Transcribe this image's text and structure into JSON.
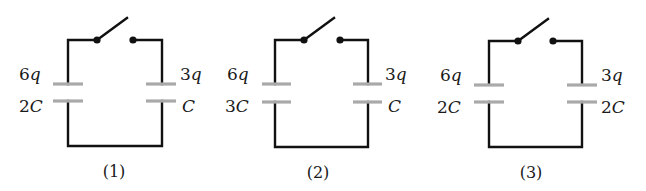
{
  "figure": {
    "colors": {
      "wire": "#111111",
      "plate": "#a9a9a9",
      "text": "#1a1a1a",
      "background": "#ffffff"
    },
    "circuits": [
      {
        "caption": "(1)",
        "left": {
          "charge": "6q",
          "charge_coef": "6",
          "charge_sym": "q",
          "capacitance": "2C",
          "cap_coef": "2",
          "cap_sym": "C"
        },
        "right": {
          "charge": "3q",
          "charge_coef": "3",
          "charge_sym": "q",
          "capacitance": "C",
          "cap_coef": "",
          "cap_sym": "C"
        },
        "switch": "open"
      },
      {
        "caption": "(2)",
        "left": {
          "charge": "6q",
          "charge_coef": "6",
          "charge_sym": "q",
          "capacitance": "3C",
          "cap_coef": "3",
          "cap_sym": "C"
        },
        "right": {
          "charge": "3q",
          "charge_coef": "3",
          "charge_sym": "q",
          "capacitance": "C",
          "cap_coef": "",
          "cap_sym": "C"
        },
        "switch": "open"
      },
      {
        "caption": "(3)",
        "left": {
          "charge": "6q",
          "charge_coef": "6",
          "charge_sym": "q",
          "capacitance": "2C",
          "cap_coef": "2",
          "cap_sym": "C"
        },
        "right": {
          "charge": "3q",
          "charge_coef": "3",
          "charge_sym": "q",
          "capacitance": "2C",
          "cap_coef": "2",
          "cap_sym": "C"
        },
        "switch": "open"
      }
    ]
  }
}
